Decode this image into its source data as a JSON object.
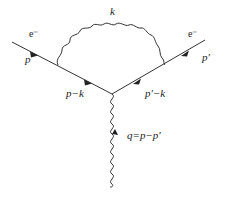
{
  "diagram": {
    "type": "feynman",
    "title": "",
    "incoming_particle": {
      "name": "e⁻",
      "momentum": "p"
    },
    "outgoing_particle": {
      "name": "e⁻",
      "momentum": "p′"
    },
    "internal_fermion_left": {
      "momentum": "p−k"
    },
    "internal_fermion_right": {
      "momentum": "p′−k"
    },
    "loop_photon": {
      "momentum": "k"
    },
    "external_photon": {
      "momentum": "q=p−p′"
    },
    "colors": {
      "line": "#333333",
      "background": "#ffffff"
    }
  }
}
